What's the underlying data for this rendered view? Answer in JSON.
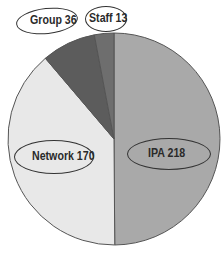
{
  "chart_data": {
    "type": "pie",
    "title": "",
    "categories": [
      "IPA",
      "Network",
      "Group",
      "Staff"
    ],
    "values": [
      218,
      170,
      36,
      13
    ],
    "colors": [
      "#a9a9a9",
      "#e8e8e8",
      "#5c5c5c",
      "#6e6e6e"
    ],
    "labels": [
      "IPA 218",
      "Network 170",
      "Group 36",
      "Staff 13"
    ],
    "start_angle_deg": 0,
    "direction": "clockwise",
    "legend": "none"
  },
  "labels": {
    "ipa": "IPA 218",
    "network": "Network 170",
    "group": "Group 36",
    "staff": "Staff 13"
  }
}
